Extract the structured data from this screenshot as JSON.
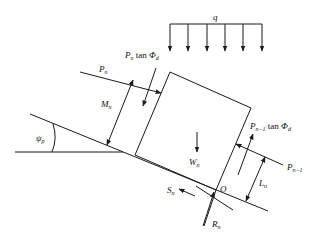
{
  "diagram": {
    "type": "free-body diagram of slope block",
    "labels": {
      "q": "q",
      "pn": "P",
      "pn_sub": "n",
      "pn_tan": "P",
      "pn_tan_sub": "n",
      "tan_text": " tan ",
      "phi": "Φ",
      "phi_sub": "d",
      "mn": "M",
      "mn_sub": "n",
      "psi": "ψ",
      "psi_sub": "p",
      "wn": "W",
      "wn_sub": "n",
      "pn1_tan": "P",
      "pn1_tan_sub": "n−1",
      "pn1": "P",
      "pn1_sub": "n−1",
      "ln": "L",
      "ln_sub": "n",
      "o": "O",
      "sn": "S",
      "sn_sub": "n",
      "rn": "R",
      "rn_sub": "n"
    },
    "distributed_load_arrows": 6,
    "line_color": "#1a1a1a"
  }
}
